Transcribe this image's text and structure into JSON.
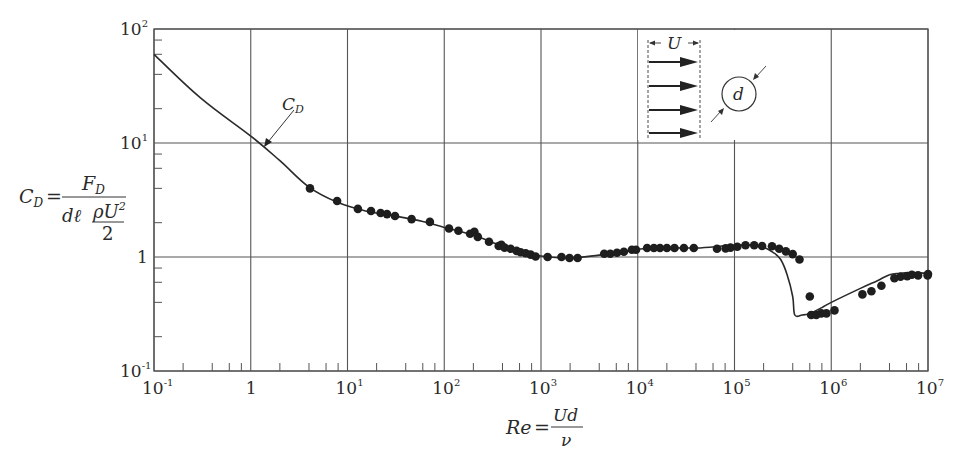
{
  "chart_data": {
    "type": "scatter",
    "title": "",
    "xlabel": "Re = Ud / ν",
    "ylabel": "C_D = F_D / (d ℓ ρU²/2)",
    "xscale": "log",
    "yscale": "log",
    "xlim": [
      0.1,
      10000000
    ],
    "ylim": [
      0.1,
      100
    ],
    "grid": true,
    "x_ticks": [
      {
        "base": "10",
        "exp": "-1",
        "value": 0.1
      },
      {
        "base": "1",
        "exp": "",
        "value": 1
      },
      {
        "base": "10",
        "exp": "1",
        "value": 10
      },
      {
        "base": "10",
        "exp": "2",
        "value": 100
      },
      {
        "base": "10",
        "exp": "3",
        "value": 1000
      },
      {
        "base": "10",
        "exp": "4",
        "value": 10000
      },
      {
        "base": "10",
        "exp": "5",
        "value": 100000
      },
      {
        "base": "10",
        "exp": "6",
        "value": 1000000
      },
      {
        "base": "10",
        "exp": "7",
        "value": 10000000
      }
    ],
    "y_ticks": [
      {
        "base": "10",
        "exp": "-1",
        "value": 0.1
      },
      {
        "base": "1",
        "exp": "",
        "value": 1
      },
      {
        "base": "10",
        "exp": "1",
        "value": 10
      },
      {
        "base": "10",
        "exp": "2",
        "value": 100
      }
    ],
    "annotations": [
      {
        "text": "C",
        "sub": "D",
        "target_re": 1.3,
        "target_cd": 10.5
      }
    ],
    "series": [
      {
        "name": "C_D curve",
        "kind": "line",
        "points": [
          [
            0.1,
            60
          ],
          [
            0.3,
            25
          ],
          [
            1,
            11.5
          ],
          [
            2,
            7
          ],
          [
            4,
            4.1
          ],
          [
            8,
            3.0
          ],
          [
            15,
            2.55
          ],
          [
            30,
            2.3
          ],
          [
            60,
            2.05
          ],
          [
            100,
            1.82
          ],
          [
            200,
            1.55
          ],
          [
            400,
            1.25
          ],
          [
            700,
            1.1
          ],
          [
            1000,
            1.02
          ],
          [
            2000,
            0.98
          ],
          [
            4000,
            1.04
          ],
          [
            7000,
            1.1
          ],
          [
            10000,
            1.17
          ],
          [
            20000,
            1.2
          ],
          [
            40000,
            1.2
          ],
          [
            70000,
            1.24
          ],
          [
            100000,
            1.27
          ],
          [
            150000,
            1.28
          ],
          [
            200000,
            1.22
          ],
          [
            250000,
            1.1
          ],
          [
            300000,
            0.95
          ],
          [
            350000,
            0.7
          ],
          [
            400000,
            0.45
          ],
          [
            420000,
            0.31
          ],
          [
            500000,
            0.31
          ],
          [
            600000,
            0.32
          ],
          [
            800000,
            0.36
          ],
          [
            1000000,
            0.4
          ],
          [
            2000000,
            0.53
          ],
          [
            3000000,
            0.62
          ],
          [
            4000000,
            0.7
          ],
          [
            5000000,
            0.72
          ],
          [
            7000000,
            0.73
          ],
          [
            10000000,
            0.72
          ]
        ]
      },
      {
        "name": "Experimental data",
        "kind": "markers",
        "points": [
          [
            4.1,
            4.0
          ],
          [
            7.8,
            3.1
          ],
          [
            12.8,
            2.64
          ],
          [
            17.5,
            2.53
          ],
          [
            22,
            2.43
          ],
          [
            25.6,
            2.38
          ],
          [
            31,
            2.29
          ],
          [
            46,
            2.15
          ],
          [
            71,
            2.03
          ],
          [
            112,
            1.78
          ],
          [
            140,
            1.7
          ],
          [
            185,
            1.6
          ],
          [
            205,
            1.66
          ],
          [
            222,
            1.5
          ],
          [
            290,
            1.36
          ],
          [
            365,
            1.25
          ],
          [
            390,
            1.28
          ],
          [
            420,
            1.21
          ],
          [
            485,
            1.18
          ],
          [
            560,
            1.13
          ],
          [
            615,
            1.1
          ],
          [
            695,
            1.08
          ],
          [
            780,
            1.05
          ],
          [
            880,
            1.01
          ],
          [
            1170,
            1.0
          ],
          [
            1630,
            1.0
          ],
          [
            1970,
            0.98
          ],
          [
            2390,
            0.98
          ],
          [
            4500,
            1.07
          ],
          [
            5200,
            1.07
          ],
          [
            6100,
            1.09
          ],
          [
            7200,
            1.11
          ],
          [
            8700,
            1.16
          ],
          [
            9600,
            1.16
          ],
          [
            12500,
            1.2
          ],
          [
            14700,
            1.2
          ],
          [
            17000,
            1.2
          ],
          [
            20000,
            1.2
          ],
          [
            24000,
            1.2
          ],
          [
            30000,
            1.2
          ],
          [
            38000,
            1.2
          ],
          [
            66000,
            1.18
          ],
          [
            81000,
            1.19
          ],
          [
            91000,
            1.21
          ],
          [
            107000,
            1.23
          ],
          [
            130000,
            1.27
          ],
          [
            160000,
            1.27
          ],
          [
            193000,
            1.25
          ],
          [
            244000,
            1.24
          ],
          [
            290000,
            1.18
          ],
          [
            340000,
            1.12
          ],
          [
            400000,
            1.06
          ],
          [
            470000,
            0.95
          ],
          [
            600000,
            0.45
          ],
          [
            620000,
            0.31
          ],
          [
            700000,
            0.31
          ],
          [
            790000,
            0.32
          ],
          [
            890000,
            0.32
          ],
          [
            1080000,
            0.34
          ],
          [
            2100000,
            0.47
          ],
          [
            2600000,
            0.5
          ],
          [
            3300000,
            0.56
          ],
          [
            4500000,
            0.65
          ],
          [
            5200000,
            0.67
          ],
          [
            6100000,
            0.68
          ],
          [
            6800000,
            0.7
          ],
          [
            7900000,
            0.69
          ],
          [
            9900000,
            0.69
          ],
          [
            10000000,
            0.71
          ]
        ]
      }
    ],
    "inset": {
      "description": "uniform flow U approaching cylinder of diameter d",
      "flow_label": "U",
      "cylinder_label": "d",
      "arrow_count": 4
    }
  },
  "labels": {
    "ylabel_lhs": "C",
    "ylabel_lhs_sub": "D",
    "ylabel_eq": "=",
    "ylabel_num": "F",
    "ylabel_num_sub": "D",
    "ylabel_den_a": "dℓ",
    "ylabel_den_frac_num": "ρU",
    "ylabel_den_frac_num_sup": "2",
    "ylabel_den_frac_den": "2",
    "xlabel_lhs": "Re",
    "xlabel_eq": "=",
    "xlabel_num": "Ud",
    "xlabel_den": "ν",
    "annotation_main": "C",
    "annotation_sub": "D",
    "inset_flow": "U",
    "inset_diam": "d"
  },
  "colors": {
    "axis": "#555555",
    "grid": "#555555",
    "line": "#2a2a2a",
    "marker": "#1e1e1e",
    "text": "#2a2a2a",
    "background": "#ffffff"
  }
}
